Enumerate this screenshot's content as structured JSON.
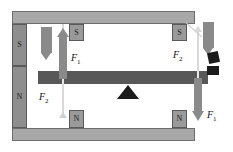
{
  "diagram": {
    "colors": {
      "frame": "#a8a8a8",
      "frame_border": "#6e6e6e",
      "magnet": "#8e8e8e",
      "pole_box": "#9a9a9a",
      "beam": "#585858",
      "arrow": "#8a8a8a",
      "fulcrum": "#1b1b1b",
      "black_block": "#1b1b1b",
      "background": "#ffffff"
    },
    "frame": {
      "top_bar_name": "top-frame-bar",
      "bottom_bar_name": "bottom-frame-bar"
    },
    "left_magnet": {
      "top_pole": "S",
      "bottom_pole": "N"
    },
    "pole_boxes": [
      {
        "label": "S",
        "position": "top-left"
      },
      {
        "label": "S",
        "position": "top-right"
      },
      {
        "label": "N",
        "position": "bottom-left"
      },
      {
        "label": "N",
        "position": "bottom-right"
      }
    ],
    "force_labels": [
      {
        "id": "f1-left",
        "text": "F",
        "sub": "1",
        "position": "upper-left",
        "direction": "up"
      },
      {
        "id": "f2-left",
        "text": "F",
        "sub": "2",
        "position": "lower-left",
        "direction": "down"
      },
      {
        "id": "f2-right",
        "text": "F",
        "sub": "2",
        "position": "upper-right",
        "direction": "up"
      },
      {
        "id": "f1-right",
        "text": "F",
        "sub": "1",
        "position": "lower-right",
        "direction": "down"
      }
    ],
    "elements": {
      "beam_name": "lever-beam",
      "fulcrum_name": "fulcrum-triangle",
      "left_block_arrow": "down-block-arrow-left",
      "right_block_arrow": "down-block-arrow-right"
    }
  }
}
